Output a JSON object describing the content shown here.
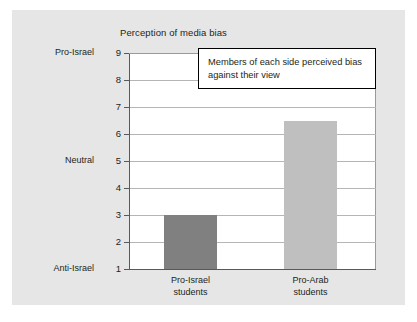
{
  "chart_data": {
    "type": "bar",
    "title": "Perception of media bias",
    "xlabel": "",
    "ylabel": "",
    "categories": [
      "Pro-Israel students",
      "Pro-Arab students"
    ],
    "category_lines": [
      [
        "Pro-Israel",
        "students"
      ],
      [
        "Pro-Arab",
        "students"
      ]
    ],
    "values": [
      3,
      6.5
    ],
    "ylim": [
      1,
      9
    ],
    "yticks": [
      1,
      2,
      3,
      4,
      5,
      6,
      7,
      8,
      9
    ],
    "ytick_labels": [
      "1",
      "2",
      "3",
      "4",
      "5",
      "6",
      "7",
      "8",
      "9"
    ],
    "y_anchor_labels": [
      {
        "value": 9,
        "label": "Pro-Israel"
      },
      {
        "value": 5,
        "label": "Neutral"
      },
      {
        "value": 1,
        "label": "Anti-Israel"
      }
    ],
    "grid": true,
    "legend": "none",
    "annotations": [
      {
        "text": "Members of each side perceived bias against their view"
      }
    ],
    "bar_colors": [
      "#808080",
      "#bfbfbf"
    ],
    "colors": {
      "panel_background": "#e6e6e6",
      "plot_background": "#ffffff",
      "axis": "#58595b",
      "gridline": "#b5b5b5",
      "text": "#231f20",
      "annotation_border": "#000000"
    }
  }
}
